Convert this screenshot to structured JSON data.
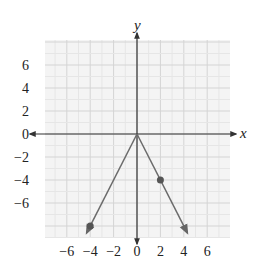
{
  "chart_data": {
    "type": "line",
    "title": "",
    "xlabel": "x",
    "ylabel": "y",
    "xlim": [
      -8,
      8
    ],
    "ylim": [
      -9,
      8
    ],
    "grid": true,
    "x_ticks": [
      "−6",
      "−4",
      "−2",
      "0",
      "2",
      "4",
      "6"
    ],
    "x_tick_values": [
      -6,
      -4,
      -2,
      0,
      2,
      4,
      6
    ],
    "y_ticks": [
      "6",
      "4",
      "2",
      "0",
      "−2",
      "−4",
      "−6"
    ],
    "y_tick_values": [
      6,
      4,
      2,
      0,
      -2,
      -4,
      -6
    ],
    "series": [
      {
        "name": "y = -2|x|",
        "x": [
          -4.3,
          -4,
          0,
          2,
          4.3
        ],
        "y": [
          -8.6,
          -8,
          0,
          -4,
          -8.6
        ],
        "marked_points": [
          [
            -4,
            -8
          ],
          [
            2,
            -4
          ]
        ],
        "arrows_at_ends": true
      }
    ],
    "colors": {
      "line": "#6b6b6b",
      "point": "#555555",
      "grid_minor": "#e6e6e6",
      "grid_major": "#d4d4d4",
      "grid_bg": "#f4f4f4",
      "axis": "#333333"
    }
  }
}
